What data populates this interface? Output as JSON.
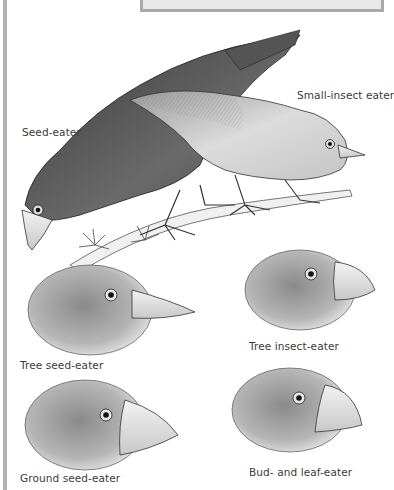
{
  "figure": {
    "colors": {
      "frame": "#b3b3b3",
      "top_box_fill": "#e9e9e9",
      "top_box_border": "#a9a9a9",
      "ink": "#2b2b2b",
      "label_text": "#3a3a3a"
    },
    "birds": [
      {
        "id": "seed-eater",
        "label": "Seed-eater",
        "view": "full body"
      },
      {
        "id": "small-insect-eater",
        "label": "Small-insect eater",
        "view": "full body"
      },
      {
        "id": "tree-seed-eater",
        "label": "Tree seed-eater",
        "view": "head"
      },
      {
        "id": "tree-insect-eater",
        "label": "Tree insect-eater",
        "view": "head"
      },
      {
        "id": "ground-seed-eater",
        "label": "Ground seed-eater",
        "view": "head"
      },
      {
        "id": "bud-and-leaf-eater",
        "label": "Bud- and leaf-eater",
        "view": "head"
      }
    ]
  }
}
